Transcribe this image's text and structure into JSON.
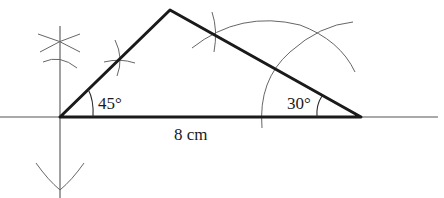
{
  "diagram": {
    "labels": {
      "left_angle": "45°",
      "right_angle": "30°",
      "base_length": "8 cm"
    },
    "vertices": {
      "left": [
        60,
        117
      ],
      "apex": [
        170,
        10
      ],
      "right": [
        361,
        117
      ]
    },
    "colors": {
      "thick_line": "#1a1a1a",
      "construction_line": "#555555",
      "background": "#ffffff"
    }
  }
}
